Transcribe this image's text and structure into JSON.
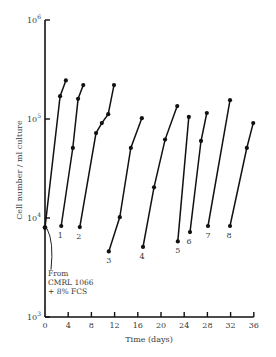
{
  "chart_data": {
    "type": "line",
    "title": "",
    "xlabel": "Time (days)",
    "ylabel": "Cell number / ml culture",
    "xlim": [
      0,
      36
    ],
    "ylim": [
      1000,
      1000000
    ],
    "yscale": "log",
    "grid": false,
    "legend": null,
    "x_ticks": [
      0,
      4,
      8,
      12,
      16,
      20,
      24,
      28,
      32,
      36
    ],
    "y_ticks": [
      {
        "value": 1000,
        "base": "10",
        "exp": "3"
      },
      {
        "value": 10000,
        "base": "10",
        "exp": "4"
      },
      {
        "value": 100000,
        "base": "10",
        "exp": "5"
      },
      {
        "value": 1000000,
        "base": "10",
        "exp": "6"
      }
    ],
    "initial_point": {
      "x": 0,
      "y": 8000
    },
    "annotation": {
      "lines": [
        "From",
        "CMRL 1066",
        "+ 8% FCS"
      ]
    },
    "series": [
      {
        "name": "0",
        "label": "",
        "points": [
          [
            0,
            8000
          ],
          [
            2.6,
            170000
          ],
          [
            3.6,
            245000
          ]
        ]
      },
      {
        "name": "1",
        "label": "1",
        "points": [
          [
            2.8,
            8300
          ],
          [
            4.8,
            51000
          ],
          [
            5.7,
            160000
          ],
          [
            6.6,
            220000
          ]
        ]
      },
      {
        "name": "2",
        "label": "2",
        "points": [
          [
            6.0,
            8100
          ],
          [
            8.8,
            72000
          ],
          [
            9.8,
            91000
          ],
          [
            10.9,
            112000
          ],
          [
            11.9,
            220000
          ]
        ]
      },
      {
        "name": "3",
        "label": "3",
        "points": [
          [
            11.0,
            4600
          ],
          [
            12.9,
            10200
          ],
          [
            14.8,
            51000
          ],
          [
            16.7,
            102000
          ]
        ]
      },
      {
        "name": "4",
        "label": "4",
        "points": [
          [
            16.9,
            5100
          ],
          [
            18.8,
            20400
          ],
          [
            20.7,
            62000
          ],
          [
            22.8,
            135000
          ]
        ]
      },
      {
        "name": "5",
        "label": "5",
        "points": [
          [
            22.9,
            5800
          ],
          [
            24.8,
            105000
          ]
        ]
      },
      {
        "name": "6",
        "label": "6",
        "points": [
          [
            25.0,
            7200
          ],
          [
            26.9,
            60000
          ],
          [
            27.9,
            115000
          ]
        ]
      },
      {
        "name": "7",
        "label": "7",
        "points": [
          [
            28.1,
            8300
          ],
          [
            31.9,
            155000
          ]
        ]
      },
      {
        "name": "8",
        "label": "8",
        "points": [
          [
            31.9,
            8300
          ],
          [
            34.8,
            51000
          ],
          [
            35.9,
            91000
          ]
        ]
      }
    ]
  },
  "layout": {
    "x0_px": 45,
    "x_px_per_day": 5.8,
    "y_top_px": 20,
    "y_px_per_decade": 99,
    "y_top_log": 6,
    "label_offsets": {
      "1": [
        -1,
        12
      ],
      "2": [
        -1,
        12
      ],
      "3": [
        0,
        12
      ],
      "4": [
        -1,
        12
      ],
      "5": [
        0,
        12
      ],
      "6": [
        -1,
        12
      ],
      "7": [
        0,
        12
      ],
      "8": [
        -1,
        12
      ]
    }
  }
}
